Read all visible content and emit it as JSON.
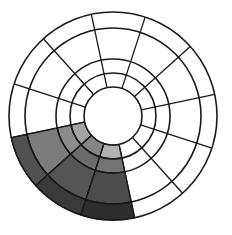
{
  "diagram": {
    "type": "segmented-radial-wheel",
    "center": [
      113,
      116
    ],
    "radii": [
      29,
      43,
      57,
      88,
      104
    ],
    "sector_count": 12,
    "start_angle_deg": 12,
    "sector_step_deg": 30,
    "line_color": "#1a1a1a",
    "background": "#ffffff",
    "shaded_sectors": [
      {
        "from_deg": 192,
        "to_deg": 222,
        "ring_colors": [
          "#a4a4a4",
          "#8c8c8c",
          "#7c7c7c",
          "#525252"
        ]
      },
      {
        "from_deg": 222,
        "to_deg": 252,
        "ring_colors": [
          "#858585",
          "#6c6c6c",
          "#555555",
          "#3a3a3a"
        ]
      },
      {
        "from_deg": 252,
        "to_deg": 282,
        "ring_colors": [
          "#b2b2b2",
          "#747474",
          "#4c4c4c",
          "#2e2e2e"
        ]
      }
    ]
  }
}
